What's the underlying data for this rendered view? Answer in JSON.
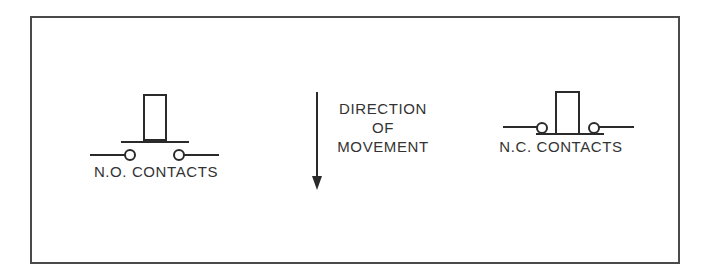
{
  "diagram": {
    "left": {
      "label": "N.O. CONTACTS"
    },
    "center": {
      "line1": "DIRECTION",
      "line2": "OF",
      "line3": "MOVEMENT",
      "arrow": "down-arrow-icon"
    },
    "right": {
      "label": "N.C. CONTACTS"
    }
  },
  "colors": {
    "line": "#2a2a2a",
    "border": "#4a4a4a",
    "background": "#ffffff"
  }
}
